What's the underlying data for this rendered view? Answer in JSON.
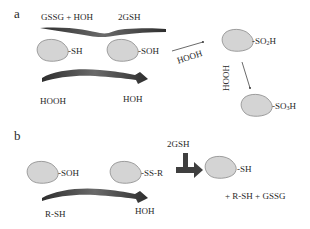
{
  "panels": {
    "a": {
      "label": "a",
      "top_left_text": "GSSG + HOH",
      "top_right_text": "2GSH",
      "protein1_group": "-SH",
      "protein2_group": "-SOH",
      "bottom_left_text": "HOOH",
      "bottom_right_text": "HOH",
      "arrow1_label": "HOOH",
      "protein3_group_prefix": "-SO",
      "protein3_group_sub": "2",
      "protein3_group_suffix": "H",
      "arrow2_label": "HOOH",
      "protein4_group_prefix": "-SO",
      "protein4_group_sub": "3",
      "protein4_group_suffix": "H"
    },
    "b": {
      "label": "b",
      "protein1_group": "-SOH",
      "protein2_group": "-SS-R",
      "reagent_top": "2GSH",
      "protein3_group": "-SH",
      "bottom_left_text": "R-SH",
      "bottom_right_text": "HOH",
      "products_text": "+ R-SH + GSSG"
    }
  },
  "colors": {
    "protein_fill": "#d4d4d4",
    "protein_stroke": "#8a8a8a",
    "arrow_dark": "#3a3a3a"
  }
}
